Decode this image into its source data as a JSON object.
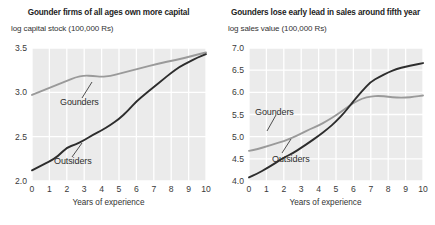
{
  "figure": {
    "background_color": "#ffffff",
    "plot_background_color": "#ebebeb",
    "gridline_color": "#ffffff",
    "gounders_color": "#9a9a9a",
    "outsiders_color": "#2d2d2d"
  },
  "panels": [
    {
      "title": "Gounder firms of all ages own more capital",
      "unit_label": "log capital stock (100,000 Rs)",
      "xaxis_title": "Years of experience",
      "gounders_label": "Gounders",
      "outsiders_label": "Outsiders"
    },
    {
      "title": "Gounders lose early lead in sales around fifth year",
      "unit_label": "log sales value (100,000 Rs)",
      "xaxis_title": "Years of experience",
      "gounders_label": "Gounders",
      "outsiders_label": "Outsiders"
    }
  ],
  "chart_data": [
    {
      "type": "line",
      "title": "Gounder firms of all ages own more capital",
      "xlabel": "Years of experience",
      "ylabel": "log capital stock (100,000 Rs)",
      "xlim": [
        0,
        10
      ],
      "ylim": [
        2.0,
        3.5
      ],
      "xticks": [
        0,
        1,
        2,
        3,
        4,
        5,
        6,
        7,
        8,
        9,
        10
      ],
      "yticks": [
        2.0,
        2.5,
        3.0,
        3.5
      ],
      "grid": true,
      "legend_position": "inline-annotations",
      "x": [
        0,
        0.5,
        1,
        1.5,
        2,
        2.5,
        3,
        3.5,
        4,
        4.5,
        5,
        5.5,
        6,
        6.5,
        7,
        7.5,
        8,
        8.5,
        9,
        9.5,
        10
      ],
      "series": [
        {
          "name": "Gounders",
          "color": "#9a9a9a",
          "values": [
            2.97,
            3.01,
            3.05,
            3.09,
            3.13,
            3.17,
            3.19,
            3.185,
            3.175,
            3.185,
            3.21,
            3.235,
            3.26,
            3.285,
            3.31,
            3.335,
            3.355,
            3.375,
            3.4,
            3.425,
            3.45
          ]
        },
        {
          "name": "Outsiders",
          "color": "#2d2d2d",
          "values": [
            2.12,
            2.17,
            2.22,
            2.28,
            2.38,
            2.41,
            2.46,
            2.52,
            2.57,
            2.63,
            2.7,
            2.79,
            2.9,
            2.98,
            3.06,
            3.14,
            3.22,
            3.29,
            3.34,
            3.39,
            3.43
          ]
        }
      ]
    },
    {
      "type": "line",
      "title": "Gounders lose early lead in sales around fifth year",
      "xlabel": "Years of experience",
      "ylabel": "log sales value (100,000 Rs)",
      "xlim": [
        0,
        10
      ],
      "ylim": [
        4.0,
        7.0
      ],
      "xticks": [
        0,
        1,
        2,
        3,
        4,
        5,
        6,
        7,
        8,
        9,
        10
      ],
      "yticks": [
        4.0,
        4.5,
        5.0,
        5.5,
        6.0,
        6.5,
        7.0
      ],
      "grid": true,
      "legend_position": "inline-annotations",
      "x": [
        0,
        0.5,
        1,
        1.5,
        2,
        2.5,
        3,
        3.5,
        4,
        4.5,
        5,
        5.5,
        6,
        6.5,
        7,
        7.5,
        8,
        8.5,
        9,
        9.5,
        10
      ],
      "series": [
        {
          "name": "Gounders",
          "color": "#9a9a9a",
          "values": [
            4.68,
            4.72,
            4.78,
            4.84,
            4.9,
            4.98,
            5.07,
            5.17,
            5.25,
            5.36,
            5.48,
            5.62,
            5.76,
            5.86,
            5.91,
            5.92,
            5.9,
            5.88,
            5.88,
            5.9,
            5.93
          ]
        },
        {
          "name": "Outsiders",
          "color": "#2d2d2d",
          "values": [
            4.08,
            4.17,
            4.28,
            4.4,
            4.53,
            4.62,
            4.75,
            4.88,
            5.02,
            5.17,
            5.34,
            5.55,
            5.8,
            6.03,
            6.24,
            6.35,
            6.45,
            6.53,
            6.58,
            6.62,
            6.66
          ]
        }
      ]
    }
  ]
}
